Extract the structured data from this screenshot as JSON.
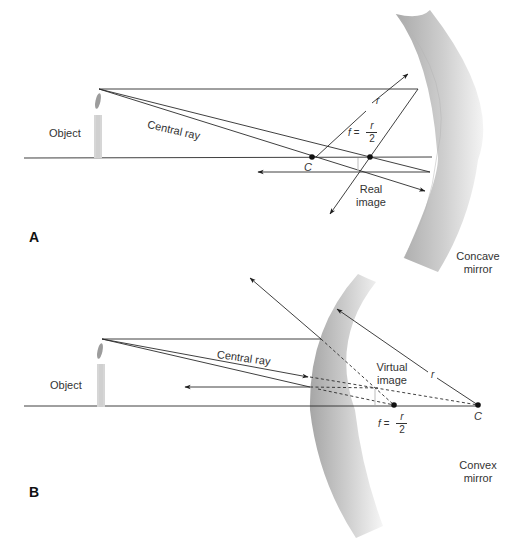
{
  "panels": {
    "a": {
      "panel_label": "A",
      "object_label": "Object",
      "central_ray_label": "Central ray",
      "radius_label": "r",
      "center_label": "C",
      "focal_label": {
        "prefix": "f =",
        "numerator": "r",
        "denominator": "2"
      },
      "image_label": "Real\nimage",
      "image_label_line1": "Real",
      "image_label_line2": "image",
      "mirror_label_line1": "Concave",
      "mirror_label_line2": "mirror"
    },
    "b": {
      "panel_label": "B",
      "object_label": "Object",
      "central_ray_label": "Central ray",
      "radius_label": "r",
      "center_label": "C",
      "focal_label": {
        "prefix": "f =",
        "numerator": "r",
        "denominator": "2"
      },
      "image_label_line1": "Virtual",
      "image_label_line2": "image",
      "mirror_label_line1": "Convex",
      "mirror_label_line2": "mirror"
    }
  },
  "colors": {
    "line": "#2a2a2a",
    "mirror_dark": "#a8a8a8",
    "mirror_light": "#f2f2f2",
    "candle": "#cfcfcf",
    "flame": "#9a9a9a"
  }
}
